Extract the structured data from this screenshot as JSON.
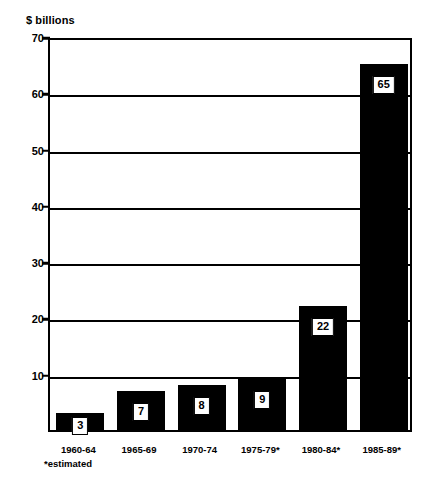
{
  "chart_data": {
    "type": "bar",
    "title": "",
    "ylabel": "$ billions",
    "xlabel": "",
    "categories": [
      "1960-64",
      "1965-69",
      "1970-74",
      "1975-79*",
      "1980-84*",
      "1985-89*"
    ],
    "values": [
      3,
      7,
      8,
      9,
      22,
      65
    ],
    "value_labels": [
      "3",
      "7",
      "8",
      "9",
      "22",
      "65"
    ],
    "ylim": [
      0,
      70
    ],
    "yticks": [
      10,
      20,
      30,
      40,
      50,
      60,
      70
    ],
    "ytick_labels": [
      "10",
      "20",
      "30",
      "40",
      "50",
      "60",
      "70"
    ],
    "grid": true,
    "grid_axis": "y",
    "legend": false,
    "bar_color": "#000000",
    "label_box_fill": "#ffffff",
    "label_box_border": "#000000",
    "axis_color": "#000000",
    "background": "#ffffff",
    "footnote": "*estimated"
  }
}
